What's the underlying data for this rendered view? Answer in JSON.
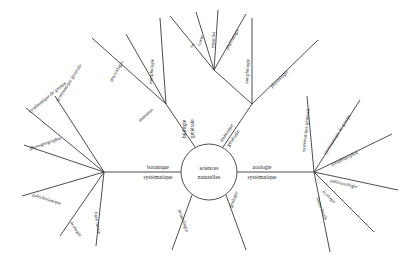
{
  "figure": {
    "type": "radial-tree-diagram",
    "language": "fr",
    "background_color": "#ffffff",
    "line_color": "#3a3a3a",
    "text_color": "#1c1c1c"
  },
  "center": {
    "label_line1": "sciences",
    "label_line2": "naturelles"
  },
  "branches": {
    "botany_hub": {
      "label_line1": "botanique",
      "label_line2": "systématique"
    },
    "zoology_hub": {
      "label_line1": "zoologie",
      "label_line2": "systématique"
    },
    "biology_general": {
      "label_line1": "biologie",
      "label_line2": "générale"
    },
    "anatomy_general": {
      "label_line1": "anatomie",
      "label_line2": "générale"
    }
  },
  "botany_leaves": [
    {
      "label": "systématique de groupe"
    },
    {
      "label": "systématique générale"
    },
    {
      "label": "phytogéographie"
    },
    {
      "label": "paléobotanique"
    },
    {
      "label": "écologie"
    },
    {
      "label": "flore locale"
    }
  ],
  "zoology_leaves": [
    {
      "label": "systématique générale"
    },
    {
      "label": "systématique de groupe"
    },
    {
      "label": "zoogéographie"
    },
    {
      "label": "paléozoologie"
    },
    {
      "label": "écologie"
    },
    {
      "label": "faune locale"
    }
  ],
  "biology_left_branch": [
    {
      "label": "anatomie"
    },
    {
      "label": "physiologie"
    },
    {
      "label": "morphologie"
    }
  ],
  "anatomy_right_branch": [
    {
      "label": "morphologie"
    },
    {
      "label": "physiologie"
    }
  ],
  "anatomy_fan": [
    {
      "label": "os"
    },
    {
      "label": "coeur"
    },
    {
      "label": "muscles"
    },
    {
      "label": "physiologie"
    }
  ],
  "earth_leaves": [
    {
      "label": "minéralogie"
    },
    {
      "label": "géologie"
    }
  ]
}
